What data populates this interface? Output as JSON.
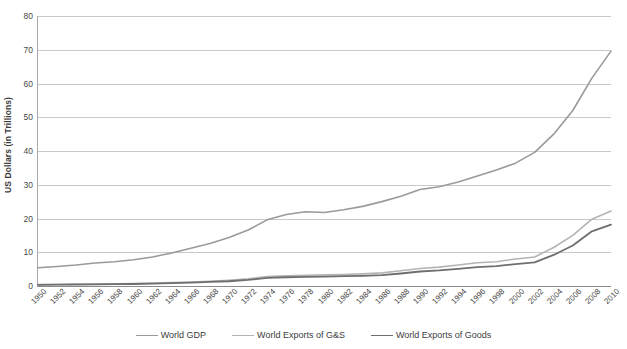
{
  "chart_data": {
    "type": "line",
    "title": "",
    "xlabel": "",
    "ylabel": "US Dollars (in Trillions)",
    "ylim": [
      0,
      80
    ],
    "yticks": [
      0,
      10,
      20,
      30,
      40,
      50,
      60,
      70,
      80
    ],
    "grid": true,
    "legend_position": "bottom",
    "x": [
      1950,
      1952,
      1954,
      1956,
      1958,
      1960,
      1962,
      1964,
      1966,
      1968,
      1970,
      1972,
      1974,
      1976,
      1978,
      1980,
      1982,
      1984,
      1986,
      1988,
      1990,
      1992,
      1994,
      1996,
      1998,
      2000,
      2002,
      2004,
      2006,
      2008,
      2010
    ],
    "xticklabels": [
      "1950",
      "1952",
      "1954",
      "1956",
      "1958",
      "1960",
      "1962",
      "1964",
      "1966",
      "1968",
      "1970",
      "1972",
      "1974",
      "1976",
      "1978",
      "1980",
      "1982",
      "1984",
      "1986",
      "1988",
      "1990",
      "1992",
      "1994",
      "1996",
      "1998",
      "2000",
      "2002",
      "2004",
      "2006",
      "2008",
      "2010"
    ],
    "series": [
      {
        "name": "World GDP",
        "color": "#9a9a9a",
        "width": 1.6,
        "values": [
          5.4,
          5.8,
          6.2,
          6.8,
          7.2,
          7.8,
          8.6,
          9.8,
          11.2,
          12.6,
          14.4,
          16.6,
          19.6,
          21.2,
          22.0,
          21.8,
          22.6,
          23.6,
          25.0,
          26.6,
          28.6,
          29.4,
          30.8,
          32.6,
          34.4,
          36.4,
          39.6,
          45.0,
          52.0,
          61.6,
          69.6
        ]
      },
      {
        "name": "World Exports of G&S",
        "color": "#b4b4b4",
        "width": 1.6,
        "values": [
          0.4,
          0.45,
          0.5,
          0.6,
          0.65,
          0.75,
          0.85,
          1.0,
          1.2,
          1.4,
          1.7,
          2.1,
          2.8,
          3.0,
          3.2,
          3.3,
          3.4,
          3.6,
          3.9,
          4.5,
          5.2,
          5.6,
          6.2,
          6.9,
          7.2,
          8.0,
          8.6,
          11.4,
          15.0,
          19.8,
          22.2
        ]
      },
      {
        "name": "World Exports of Goods",
        "color": "#6e6e6e",
        "width": 1.8,
        "values": [
          0.35,
          0.4,
          0.45,
          0.5,
          0.55,
          0.6,
          0.7,
          0.85,
          1.0,
          1.2,
          1.4,
          1.8,
          2.4,
          2.6,
          2.7,
          2.8,
          2.9,
          3.0,
          3.2,
          3.7,
          4.3,
          4.6,
          5.1,
          5.6,
          5.9,
          6.5,
          7.0,
          9.2,
          12.0,
          16.2,
          18.2
        ]
      }
    ]
  },
  "axis": {
    "y_title": "US Dollars (in Trillions)"
  },
  "legend": {
    "items": [
      {
        "label": "World GDP"
      },
      {
        "label": "World Exports of G&S"
      },
      {
        "label": "World Exports of Goods"
      }
    ]
  },
  "colors": {
    "gdp": "#9a9a9a",
    "exports_gs": "#b4b4b4",
    "exports_goods": "#6e6e6e",
    "grid": "#c9c9c9",
    "axis": "#8a8a8a",
    "text": "#3c3c3c",
    "background": "#ffffff"
  }
}
